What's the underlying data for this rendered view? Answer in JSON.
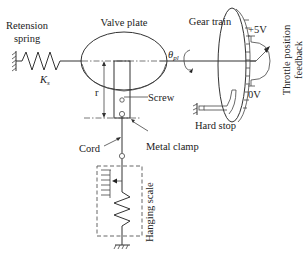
{
  "diagram": {
    "type": "schematic",
    "labels": {
      "retension_spring_line1": "Retension",
      "retension_spring_line2": "spring",
      "spring_constant": "K",
      "spring_constant_sub": "s",
      "valve_plate": "Valve plate",
      "gear_train": "Gear train",
      "angle_symbol": "θ",
      "angle_sub": "pl",
      "plus_5v": "+5V",
      "zero_v": "0V",
      "throttle_feedback_line1": "Throttle position",
      "throttle_feedback_line2": "feedback",
      "radius": "r",
      "screw": "Screw",
      "hard_stop": "Hard stop",
      "cord": "Cord",
      "metal_clamp": "Metal clamp",
      "hanging_scale": "Hanging scale"
    },
    "components": [
      "ground-anchor-left",
      "retension-spring",
      "valve-plate",
      "lever-arm",
      "screw",
      "metal-clamp",
      "cord",
      "hanging-scale",
      "gear-train-disk",
      "potentiometer",
      "hard-stop"
    ]
  }
}
